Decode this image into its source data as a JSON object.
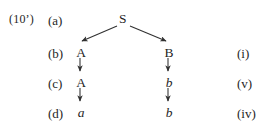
{
  "figure": {
    "example_number": "(10’)",
    "background_color": "#ffffff",
    "ink_color": "#262626"
  },
  "row_labels": {
    "a": "(a)",
    "b": "(b)",
    "c": "(c)",
    "d": "(d)"
  },
  "roman_labels": {
    "b": "(i)",
    "c": "(v)",
    "d": "(iv)"
  },
  "tree": {
    "root": "S",
    "left_branch": {
      "b": "A",
      "c": "A",
      "d": "a"
    },
    "right_branch": {
      "b": "B",
      "c": "b",
      "d": "b"
    }
  }
}
